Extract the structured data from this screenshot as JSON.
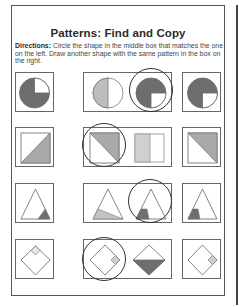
{
  "worksheet": {
    "title": "Patterns: Find and Copy",
    "directions_label": "Directions:",
    "directions_text": " Circle the shape in the middle box that matches the one on the left. Draw another shape with the same pattern in the box on the right."
  },
  "colors": {
    "dark_fill": "#6e6e6e",
    "light_fill": "#bdbdbd",
    "mid_fill": "#a9a9a9",
    "outline": "#666666",
    "circle_mark": "#333333"
  },
  "rows": [
    {
      "pattern": "circle-three-quarters-shaded",
      "left": "circle with 3/4 dark, top-right quarter white",
      "middle_options": [
        "circle half light-shaded (left half)",
        "circle 3/4 dark, bottom-right quarter white"
      ],
      "circled_option_index": 1,
      "right": "circle 3/4 dark, bottom-right quarter white"
    },
    {
      "pattern": "square-diagonal-half-shaded",
      "left": "square with bottom-right triangle shaded",
      "middle_options": [
        "square with top-right triangle shaded",
        "rectangle left half light-shaded"
      ],
      "circled_option_index": 0,
      "right": "square with top-right triangle shaded"
    },
    {
      "pattern": "triangle-corner-shaded",
      "left": "triangle with bottom-right corner shaded",
      "middle_options": [
        "triangle with bottom band light-shaded",
        "triangle with bottom-left corner shaded"
      ],
      "circled_option_index": 1,
      "right": "triangle with bottom-left corner shaded"
    },
    {
      "pattern": "diamond-with-small-diamond",
      "left": "diamond with small diamond at top corner",
      "middle_options": [
        "diamond with small shaded diamond at right corner",
        "diamond with bottom half dark"
      ],
      "circled_option_index": 0,
      "right": "diamond with small shaded diamond at right corner"
    }
  ]
}
